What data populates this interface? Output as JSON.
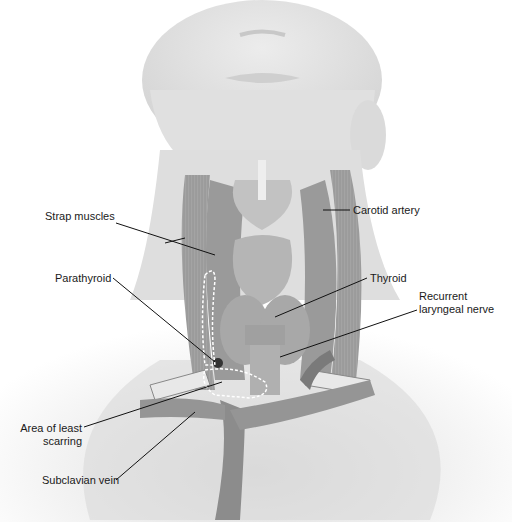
{
  "figure": {
    "colors": {
      "skin": "#e2e2e2",
      "muscle": "#a6a6a6",
      "muscle_dark": "#7c7c7c",
      "gland": "#b8b8b8",
      "vessel": "#8c8c8c",
      "label_text": "#1a1a1a",
      "leader_line": "#111111",
      "dashed_outline": "#ffffff"
    },
    "labels": [
      {
        "id": "strap-muscles",
        "text": "Strap muscles",
        "x": 45,
        "y": 216
      },
      {
        "id": "carotid-artery",
        "text": "Carotid artery",
        "x": 354,
        "y": 204
      },
      {
        "id": "parathyroid",
        "text": "Parathyroid",
        "x": 55,
        "y": 272
      },
      {
        "id": "thyroid",
        "text": "Thyroid",
        "x": 370,
        "y": 272
      },
      {
        "id": "recurrent-laryngeal-nerve",
        "text": "Recurrent",
        "text2": "laryngeal nerve",
        "x": 419,
        "y": 290
      },
      {
        "id": "area-of-least-scarring",
        "text": "Area of least",
        "text2": "scarring",
        "x": 20,
        "y": 420
      },
      {
        "id": "subclavian-vein",
        "text": "Subclavian vein",
        "x": 42,
        "y": 474
      }
    ]
  }
}
